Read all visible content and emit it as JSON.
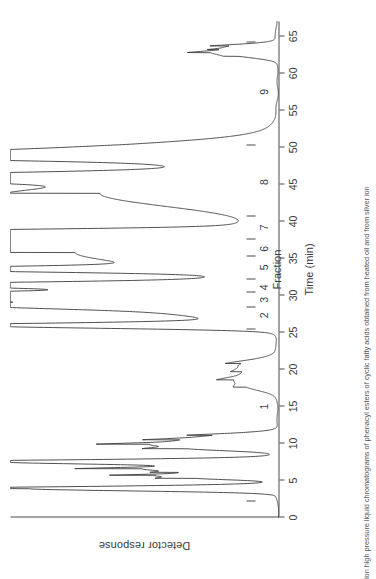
{
  "figure": {
    "caption": "ion high pressure liquid chromatograms of phenacyl esters of cyclic fatty acids obtained from heated oil and from silver ion",
    "orientation_note": "rotated"
  },
  "axes": {
    "y_label": "Detector response",
    "x_label": "Time (min)",
    "fraction_label": "Fraction",
    "x_ticks": [
      0,
      5,
      10,
      15,
      20,
      25,
      30,
      35,
      40,
      45,
      50,
      55,
      60,
      65
    ],
    "x_min": 0,
    "x_max": 67,
    "y_min": 0,
    "y_max": 100
  },
  "fractions": {
    "labels": [
      "1",
      "2",
      "3",
      "4",
      "5",
      "6",
      "7",
      "8",
      "9"
    ],
    "label_positions": [
      15.0,
      27.3,
      29.4,
      31.1,
      33.8,
      36.3,
      39.2,
      45.3,
      57.5
    ],
    "dividers": [
      2.2,
      25.4,
      28.3,
      30.4,
      32.1,
      35.2,
      37.6,
      40.6,
      50.2,
      64.2
    ]
  },
  "chart_data": {
    "type": "line",
    "title": "",
    "xlabel": "Time (min)",
    "ylabel": "Detector response",
    "xlim": [
      0,
      67
    ],
    "ylim": [
      0,
      100
    ],
    "grid": false,
    "legend": "none",
    "series": [
      {
        "name": "chromatogram",
        "description": "HPLC trace of phenacyl esters; detector response vs retention time",
        "peaks": [
          {
            "time": 3.9,
            "height": 92,
            "width": 0.3,
            "label": "solvent front"
          },
          {
            "time": 5.3,
            "height": 26,
            "width": 0.22,
            "label": ""
          },
          {
            "time": 5.7,
            "height": 34,
            "width": 0.2,
            "label": ""
          },
          {
            "time": 6.1,
            "height": 20,
            "width": 0.22,
            "label": ""
          },
          {
            "time": 6.6,
            "height": 46,
            "width": 0.28,
            "label": ""
          },
          {
            "time": 7.5,
            "height": 100,
            "width": 0.3,
            "label": "major early peak"
          },
          {
            "time": 9.3,
            "height": 30,
            "width": 0.3,
            "label": ""
          },
          {
            "time": 9.9,
            "height": 38,
            "width": 0.28,
            "label": ""
          },
          {
            "time": 10.5,
            "height": 26,
            "width": 0.3,
            "label": ""
          },
          {
            "time": 11.1,
            "height": 19,
            "width": 0.34,
            "label": ""
          },
          {
            "time": 17.6,
            "height": 9,
            "width": 0.55,
            "label": ""
          },
          {
            "time": 18.6,
            "height": 12,
            "width": 0.55,
            "label": ""
          },
          {
            "time": 19.7,
            "height": 8,
            "width": 0.6,
            "label": ""
          },
          {
            "time": 20.8,
            "height": 11,
            "width": 0.6,
            "label": ""
          },
          {
            "time": 25.9,
            "height": 100,
            "width": 0.34,
            "label": "fraction 2 peak"
          },
          {
            "time": 28.6,
            "height": 48,
            "width": 0.4,
            "label": ""
          },
          {
            "time": 29.1,
            "height": 66,
            "width": 1.6,
            "label": ""
          },
          {
            "time": 30.0,
            "height": 100,
            "width": 0.36,
            "label": "fraction 4 peak"
          },
          {
            "time": 31.4,
            "height": 100,
            "width": 0.36,
            "label": "fraction 5 peak"
          },
          {
            "time": 33.5,
            "height": 100,
            "width": 0.34,
            "label": ""
          },
          {
            "time": 35.8,
            "height": 74,
            "width": 1.7,
            "label": "broad peak"
          },
          {
            "time": 37.3,
            "height": 54,
            "width": 0.4,
            "label": ""
          },
          {
            "time": 37.8,
            "height": 100,
            "width": 0.32,
            "label": "fraction 7 peak"
          },
          {
            "time": 38.6,
            "height": 100,
            "width": 0.32,
            "label": ""
          },
          {
            "time": 43.8,
            "height": 66,
            "width": 1.8,
            "label": ""
          },
          {
            "time": 45.5,
            "height": 52,
            "width": 0.4,
            "label": ""
          },
          {
            "time": 46.2,
            "height": 78,
            "width": 0.45,
            "label": "fraction 8 peak"
          },
          {
            "time": 48.7,
            "height": 86,
            "width": 0.4,
            "label": ""
          },
          {
            "time": 49.2,
            "height": 72,
            "width": 1.2,
            "label": "tailing"
          },
          {
            "time": 62.3,
            "height": 10,
            "width": 0.35,
            "label": ""
          },
          {
            "time": 62.8,
            "height": 16,
            "width": 0.3,
            "label": ""
          },
          {
            "time": 63.2,
            "height": 9,
            "width": 0.3,
            "label": ""
          },
          {
            "time": 63.7,
            "height": 14,
            "width": 0.3,
            "label": ""
          }
        ]
      }
    ]
  },
  "style": {
    "trace_color": "#3c3c3c",
    "axis_color": "#4a4a4a",
    "background": "#ffffff"
  }
}
